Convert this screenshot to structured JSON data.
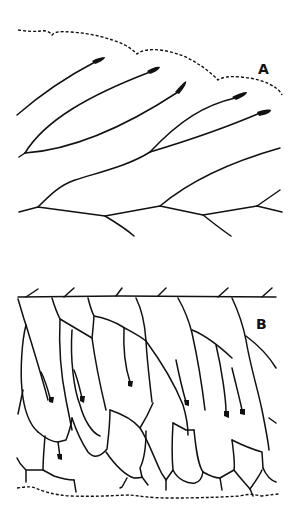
{
  "figure": {
    "panels": [
      {
        "id": "A",
        "label": "A",
        "description": "Branching lines with club-shaped dark tips beneath a dashed outline"
      },
      {
        "id": "B",
        "label": "B",
        "description": "Cellular network of elongated cells below a solid line with short oblique ticks, dashed outline at bottom"
      }
    ]
  },
  "colors": {
    "ink": "#111111",
    "background": "#ffffff"
  }
}
